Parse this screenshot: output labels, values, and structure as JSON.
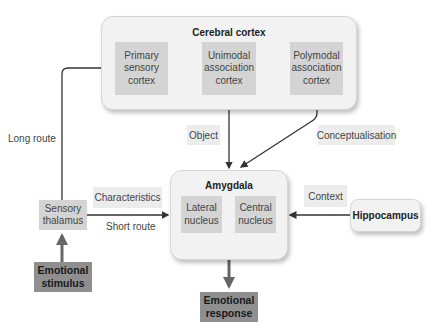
{
  "cortex": {
    "title": "Cerebral cortex",
    "primary": "Primary sensory cortex",
    "unimodal": "Unimodal association cortex",
    "polymodal": "Polymodal association cortex"
  },
  "amygdala": {
    "title": "Amygdala",
    "lateral": "Lateral nucleus",
    "central": "Central nucleus"
  },
  "nodes": {
    "thalamus": "Sensory thalamus",
    "stimulus": "Emotional stimulus",
    "response": "Emotional response",
    "hippocampus": "Hippocampus"
  },
  "labels": {
    "long_route": "Long route",
    "short_route": "Short route",
    "characteristics": "Characteristics",
    "object": "Object",
    "conceptualisation": "Conceptualisation",
    "context": "Context"
  },
  "colors": {
    "container": "#f2f2f2",
    "inner_box": "#d4d4d4",
    "dark_box": "#8f8f8f",
    "arrow": "#333333",
    "thick_arrow": "#666666"
  }
}
